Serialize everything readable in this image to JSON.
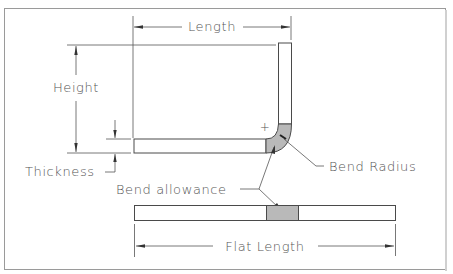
{
  "diagram": {
    "colors": {
      "line": "#4a4a4a",
      "text": "#555555",
      "bend_shading": "#b9b9b9",
      "background": "#ffffff",
      "frame": "#9a9a9a"
    },
    "labels": {
      "length": "Length",
      "height": "Height",
      "thickness": "Thickness",
      "bend_radius": "Bend Radius",
      "bend_allowance": "Bend allowance",
      "flat_length": "Flat Length"
    },
    "symbols": {
      "bend_center": "+"
    }
  }
}
